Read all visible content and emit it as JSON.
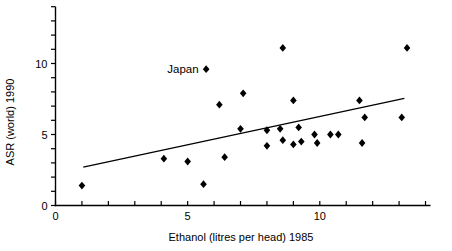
{
  "figure": {
    "width_px": 452,
    "height_px": 251,
    "background_color": "#ffffff",
    "ink_color": "#000000"
  },
  "chart_data": {
    "type": "scatter",
    "title": "",
    "xlabel": "Ethanol (litres per head) 1985",
    "ylabel": "ASR (world) 1990",
    "xlim": [
      0,
      14
    ],
    "ylim": [
      0,
      14
    ],
    "tick_step": 1,
    "x_labeled_ticks": [
      0,
      5,
      10
    ],
    "y_labeled_ticks": [
      0,
      5,
      10
    ],
    "grid": false,
    "legend": "none",
    "marker": "filled-diamond",
    "points": [
      {
        "x": 1.0,
        "y": 1.4
      },
      {
        "x": 4.1,
        "y": 3.3
      },
      {
        "x": 5.0,
        "y": 3.1
      },
      {
        "x": 5.6,
        "y": 1.5
      },
      {
        "x": 6.4,
        "y": 3.4
      },
      {
        "x": 5.7,
        "y": 9.6,
        "label": "Japan"
      },
      {
        "x": 6.2,
        "y": 7.1
      },
      {
        "x": 7.1,
        "y": 7.9
      },
      {
        "x": 8.6,
        "y": 11.1
      },
      {
        "x": 13.3,
        "y": 11.1
      },
      {
        "x": 9.0,
        "y": 7.4
      },
      {
        "x": 11.5,
        "y": 7.4
      },
      {
        "x": 11.7,
        "y": 6.2
      },
      {
        "x": 13.1,
        "y": 6.2
      },
      {
        "x": 7.0,
        "y": 5.4
      },
      {
        "x": 8.0,
        "y": 5.3
      },
      {
        "x": 8.5,
        "y": 5.4
      },
      {
        "x": 9.2,
        "y": 5.5
      },
      {
        "x": 9.8,
        "y": 5.0
      },
      {
        "x": 10.4,
        "y": 5.0
      },
      {
        "x": 10.7,
        "y": 5.0
      },
      {
        "x": 8.0,
        "y": 4.2
      },
      {
        "x": 8.6,
        "y": 4.6
      },
      {
        "x": 9.0,
        "y": 4.3
      },
      {
        "x": 9.3,
        "y": 4.5
      },
      {
        "x": 9.9,
        "y": 4.4
      },
      {
        "x": 11.6,
        "y": 4.4
      }
    ],
    "regression_line": {
      "x1": 1.05,
      "y1": 2.7,
      "x2": 13.2,
      "y2": 7.55
    }
  }
}
